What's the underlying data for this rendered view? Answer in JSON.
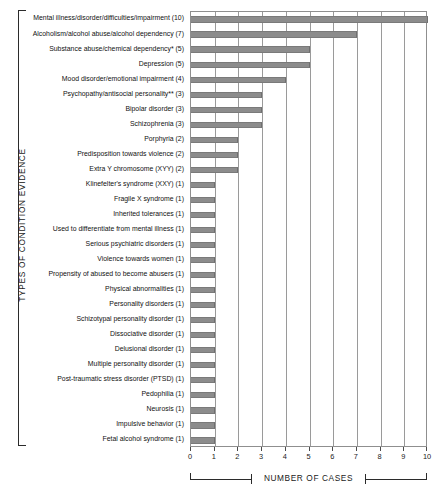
{
  "chart_data": {
    "type": "bar",
    "orientation": "horizontal",
    "title": "",
    "xlabel": "NUMBER OF CASES",
    "ylabel": "TYPES OF CONDITION EVIDENCE",
    "xlim": [
      0,
      10
    ],
    "xticks": [
      0,
      1,
      2,
      3,
      4,
      5,
      6,
      7,
      8,
      9,
      10
    ],
    "xticklabels": [
      "0",
      "1",
      "2",
      "3",
      "4",
      "5",
      "6",
      "7",
      "8",
      "9",
      "10"
    ],
    "grid": "vertical",
    "legend": "none",
    "bar_color": "#8c8c8c",
    "categories": [
      "Mental illness/disorder/difficulties/impairment (10)",
      "Alcoholism/alcohol abuse/alcohol dependency (7)",
      "Substance abuse/chemical dependency* (5)",
      "Depression (5)",
      "Mood disorder/emotional impairment (4)",
      "Psychopathy/antisocial personality** (3)",
      "Bipolar disorder (3)",
      "Schizophrenia (3)",
      "Porphyria (2)",
      "Predisposition towards violence (2)",
      "Extra Y chromosome (XYY) (2)",
      "Klinefelter's syndrome (XXY) (1)",
      "Fragile X syndrome (1)",
      "Inherited tolerances (1)",
      "Used to differentiate from mental illness (1)",
      "Serious psychiatric disorders (1)",
      "Violence towards women (1)",
      "Propensity of abused to become abusers (1)",
      "Physical abnormalities (1)",
      "Personality disorders (1)",
      "Schizotypal personality disorder (1)",
      "Dissociative disorder (1)",
      "Delusional disorder (1)",
      "Multiple personality disorder (1)",
      "Post-traumatic stress disorder (PTSD) (1)",
      "Pedophilia (1)",
      "Neurosis (1)",
      "Impulsive behavior (1)",
      "Fetal alcohol syndrome (1)"
    ],
    "values": [
      10,
      7,
      5,
      5,
      4,
      3,
      3,
      3,
      2,
      2,
      2,
      1,
      1,
      1,
      1,
      1,
      1,
      1,
      1,
      1,
      1,
      1,
      1,
      1,
      1,
      1,
      1,
      1,
      1
    ]
  }
}
